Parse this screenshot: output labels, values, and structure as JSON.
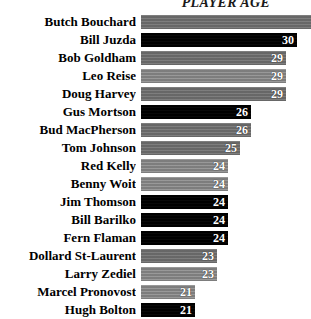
{
  "chart": {
    "title": "PLAYER AGE"
  },
  "chart_data": {
    "type": "bar",
    "orientation": "horizontal",
    "title": "PLAYER AGE",
    "xlabel": "",
    "ylabel": "",
    "grid": false,
    "legend": null,
    "value_label_position": "inside-end",
    "xlim": [
      0,
      31
    ],
    "note": "Top bar (Butch Bouchard) extends past the right edge of the image; its value label is cropped out.",
    "categories": [
      "Butch Bouchard",
      "Bill Juzda",
      "Bob Goldham",
      "Leo Reise",
      "Doug Harvey",
      "Gus Mortson",
      "Bud MacPherson",
      "Tom Johnson",
      "Red Kelly",
      "Benny Woit",
      "Jim Thomson",
      "Bill Barilko",
      "Fern Flaman",
      "Dollard St-Laurent",
      "Larry Zediel",
      "Marcel Pronovost",
      "Hugh Bolton"
    ],
    "values": [
      31,
      30,
      29,
      29,
      29,
      26,
      26,
      25,
      24,
      24,
      24,
      24,
      24,
      23,
      23,
      21,
      21
    ],
    "value_labels": [
      "",
      "30",
      "29",
      "29",
      "29",
      "26",
      "26",
      "25",
      "24",
      "24",
      "24",
      "24",
      "24",
      "23",
      "23",
      "21",
      "21"
    ]
  },
  "rows": [
    {
      "label": "Butch Bouchard",
      "value": 31,
      "value_label": "",
      "style": "gray",
      "width_px": 170
    },
    {
      "label": "Bill Juzda",
      "value": 30,
      "value_label": "30",
      "style": "dark",
      "width_px": 156
    },
    {
      "label": "Bob Goldham",
      "value": 29,
      "value_label": "29",
      "style": "gray",
      "width_px": 145
    },
    {
      "label": "Leo Reise",
      "value": 29,
      "value_label": "29",
      "style": "gray-light",
      "width_px": 145
    },
    {
      "label": "Doug Harvey",
      "value": 29,
      "value_label": "29",
      "style": "gray",
      "width_px": 145
    },
    {
      "label": "Gus Mortson",
      "value": 26,
      "value_label": "26",
      "style": "dark",
      "width_px": 110
    },
    {
      "label": "Bud MacPherson",
      "value": 26,
      "value_label": "26",
      "style": "gray",
      "width_px": 110
    },
    {
      "label": "Tom Johnson",
      "value": 25,
      "value_label": "25",
      "style": "gray",
      "width_px": 99
    },
    {
      "label": "Red Kelly",
      "value": 24,
      "value_label": "24",
      "style": "gray-light",
      "width_px": 87
    },
    {
      "label": "Benny Woit",
      "value": 24,
      "value_label": "24",
      "style": "gray-light",
      "width_px": 87
    },
    {
      "label": "Jim Thomson",
      "value": 24,
      "value_label": "24",
      "style": "dark",
      "width_px": 87
    },
    {
      "label": "Bill Barilko",
      "value": 24,
      "value_label": "24",
      "style": "dark",
      "width_px": 87
    },
    {
      "label": "Fern Flaman",
      "value": 24,
      "value_label": "24",
      "style": "dark",
      "width_px": 87
    },
    {
      "label": "Dollard St-Laurent",
      "value": 23,
      "value_label": "23",
      "style": "gray",
      "width_px": 76
    },
    {
      "label": "Larry Zediel",
      "value": 23,
      "value_label": "23",
      "style": "gray-light",
      "width_px": 76
    },
    {
      "label": "Marcel Pronovost",
      "value": 21,
      "value_label": "21",
      "style": "gray-light",
      "width_px": 54
    },
    {
      "label": "Hugh Bolton",
      "value": 21,
      "value_label": "21",
      "style": "dark",
      "width_px": 54
    }
  ],
  "colors": {
    "background": "#ffffff",
    "bar_dark": "#000000",
    "bar_gray": "#6f6f6f",
    "bar_gray_light": "#858585",
    "label_text": "#000000",
    "value_text": "#ffffff"
  }
}
